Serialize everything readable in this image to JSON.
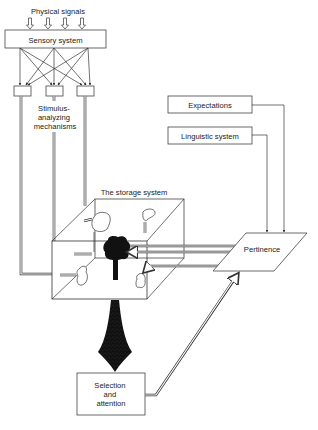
{
  "diagram": {
    "nodes": {
      "physical_signals": {
        "label": "Physical signals"
      },
      "sensory_system": {
        "label": "Sensory system"
      },
      "stimulus_analyzers": {
        "label_lines": [
          "Stimulus-",
          "analyzing",
          "mechanisms"
        ],
        "count": 3
      },
      "expectations": {
        "label": "Expectations"
      },
      "linguistic_system": {
        "label": "Linguistic system"
      },
      "storage_system": {
        "label": "The storage system"
      },
      "pertinence": {
        "label": "Pertinence"
      },
      "selection_attention": {
        "label_lines": [
          "Selection",
          "and",
          "attention"
        ]
      }
    },
    "edges": [
      {
        "from": "physical_signals",
        "to": "sensory_system",
        "style": "hollow-arrow",
        "count": 4
      },
      {
        "from": "sensory_system",
        "to": "stimulus_analyzers",
        "style": "crossing-arrows"
      },
      {
        "from": "stimulus_analyzers",
        "to": "storage_system",
        "style": "double-line"
      },
      {
        "from": "expectations",
        "to": "pertinence",
        "style": "single-line-arrow"
      },
      {
        "from": "linguistic_system",
        "to": "pertinence",
        "style": "single-line-arrow"
      },
      {
        "from": "pertinence",
        "to": "storage_system",
        "style": "double-line-arrows"
      },
      {
        "from": "storage_system",
        "to": "selection_attention",
        "style": "black-funnel"
      },
      {
        "from": "selection_attention",
        "to": "pertinence",
        "style": "double-line-arrow"
      }
    ],
    "colors": {
      "ink": "#333333",
      "fill": "#111111",
      "background": "#ffffff"
    }
  }
}
